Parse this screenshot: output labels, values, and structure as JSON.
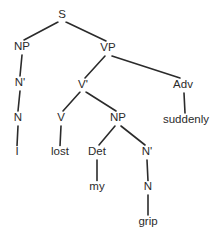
{
  "diagram": {
    "sentence": "I lost my grip suddenly",
    "type": "constituency-tree",
    "colors": {
      "background": "#ffffff",
      "line": "#2b2b2b",
      "text": "#2b2b2b"
    },
    "nodes": [
      {
        "id": "S",
        "label": "S",
        "x": 62,
        "y": 15,
        "kind": "phrasal"
      },
      {
        "id": "NP1",
        "label": "NP",
        "x": 22,
        "y": 47,
        "kind": "phrasal"
      },
      {
        "id": "VP",
        "label": "VP",
        "x": 108,
        "y": 48,
        "kind": "phrasal"
      },
      {
        "id": "Nbar1",
        "label": "N'",
        "x": 20,
        "y": 83,
        "kind": "bar"
      },
      {
        "id": "Vbar",
        "label": "V'",
        "x": 83,
        "y": 85,
        "kind": "bar"
      },
      {
        "id": "Adv",
        "label": "Adv",
        "x": 183,
        "y": 85,
        "kind": "lexical"
      },
      {
        "id": "N1",
        "label": "N",
        "x": 18,
        "y": 118,
        "kind": "lexical"
      },
      {
        "id": "V",
        "label": "V",
        "x": 61,
        "y": 118,
        "kind": "lexical"
      },
      {
        "id": "NP2",
        "label": "NP",
        "x": 118,
        "y": 118,
        "kind": "phrasal"
      },
      {
        "id": "suddenly",
        "label": "suddenly",
        "x": 186,
        "y": 120,
        "kind": "word"
      },
      {
        "id": "I",
        "label": "I",
        "x": 17,
        "y": 152,
        "kind": "word"
      },
      {
        "id": "lost",
        "label": "lost",
        "x": 60,
        "y": 152,
        "kind": "word"
      },
      {
        "id": "Det",
        "label": "Det",
        "x": 97,
        "y": 152,
        "kind": "lexical"
      },
      {
        "id": "Nbar2",
        "label": "N'",
        "x": 147,
        "y": 152,
        "kind": "bar"
      },
      {
        "id": "my",
        "label": "my",
        "x": 97,
        "y": 187,
        "kind": "word"
      },
      {
        "id": "N2",
        "label": "N",
        "x": 148,
        "y": 187,
        "kind": "lexical"
      },
      {
        "id": "grip",
        "label": "grip",
        "x": 148,
        "y": 222,
        "kind": "word"
      }
    ],
    "edges": [
      {
        "from": "S",
        "to": "NP1",
        "x1": 58,
        "y1": 22,
        "x2": 24,
        "y2": 40
      },
      {
        "from": "S",
        "to": "VP",
        "x1": 66,
        "y1": 22,
        "x2": 106,
        "y2": 41
      },
      {
        "from": "NP1",
        "to": "Nbar1",
        "x1": 22,
        "y1": 55,
        "x2": 20,
        "y2": 76
      },
      {
        "from": "Nbar1",
        "to": "N1",
        "x1": 20,
        "y1": 91,
        "x2": 18,
        "y2": 111
      },
      {
        "from": "N1",
        "to": "I",
        "x1": 18,
        "y1": 126,
        "x2": 17,
        "y2": 146
      },
      {
        "from": "VP",
        "to": "Vbar",
        "x1": 105,
        "y1": 56,
        "x2": 85,
        "y2": 78
      },
      {
        "from": "VP",
        "to": "Adv",
        "x1": 112,
        "y1": 56,
        "x2": 180,
        "y2": 78
      },
      {
        "from": "Adv",
        "to": "suddenly",
        "x1": 184,
        "y1": 93,
        "x2": 185,
        "y2": 113
      },
      {
        "from": "Vbar",
        "to": "V",
        "x1": 80,
        "y1": 92,
        "x2": 63,
        "y2": 111
      },
      {
        "from": "Vbar",
        "to": "NP2",
        "x1": 86,
        "y1": 92,
        "x2": 116,
        "y2": 111
      },
      {
        "from": "V",
        "to": "lost",
        "x1": 61,
        "y1": 126,
        "x2": 60,
        "y2": 146
      },
      {
        "from": "NP2",
        "to": "Det",
        "x1": 115,
        "y1": 126,
        "x2": 99,
        "y2": 145
      },
      {
        "from": "NP2",
        "to": "Nbar2",
        "x1": 121,
        "y1": 126,
        "x2": 145,
        "y2": 145
      },
      {
        "from": "Det",
        "to": "my",
        "x1": 97,
        "y1": 160,
        "x2": 97,
        "y2": 181
      },
      {
        "from": "Nbar2",
        "to": "N2",
        "x1": 147,
        "y1": 160,
        "x2": 148,
        "y2": 181
      },
      {
        "from": "N2",
        "to": "grip",
        "x1": 148,
        "y1": 195,
        "x2": 148,
        "y2": 215
      }
    ]
  }
}
